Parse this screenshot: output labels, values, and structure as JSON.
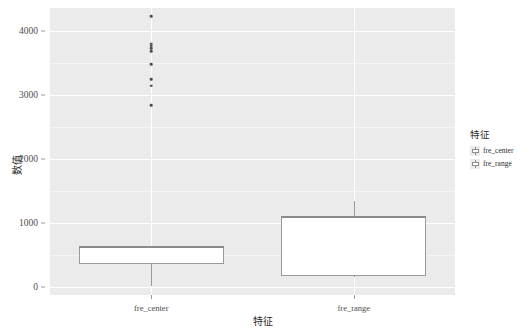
{
  "chart_data": {
    "type": "box",
    "title": "",
    "xlabel": "特征",
    "ylabel": "数值",
    "categories": [
      "fre_center",
      "fre_range"
    ],
    "ylim": [
      -120,
      4360
    ],
    "yticks": [
      0,
      1000,
      2000,
      3000,
      4000
    ],
    "ytick_labels": [
      "0",
      "1000",
      "2000",
      "3000",
      "4000"
    ],
    "minor_gridlines": [
      500,
      1500,
      2500,
      3500
    ],
    "grid": true,
    "legend": {
      "title": "特征",
      "position": "right",
      "entries": [
        {
          "label": "fre_center",
          "fill": "#FFFFFF",
          "stroke": "#8f8f8f"
        },
        {
          "label": "fre_range",
          "fill": "#FFFFFF",
          "stroke": "#8f8f8f"
        }
      ]
    },
    "boxes": [
      {
        "name": "fre_center",
        "q1": 370,
        "median": 640,
        "q3": 640,
        "whisker_low": 20,
        "whisker_high": 640,
        "outliers": [
          2840,
          3150,
          3250,
          3480,
          3690,
          3730,
          3770,
          3800,
          4230
        ]
      },
      {
        "name": "fre_range",
        "q1": 180,
        "median": 1110,
        "q3": 1090,
        "whisker_low": 155,
        "whisker_high": 1340,
        "outliers": []
      }
    ],
    "colors": {
      "panel_background": "#EBEBEB",
      "major_gridline": "#FFFFFF",
      "minor_gridline": "#F5F5F5",
      "box_fill": "#FFFFFF",
      "box_stroke": "#9a9a9a",
      "outlier": "#4a4a4a",
      "text": "#2b2b2b",
      "tick_text": "#4d4d4d"
    }
  }
}
